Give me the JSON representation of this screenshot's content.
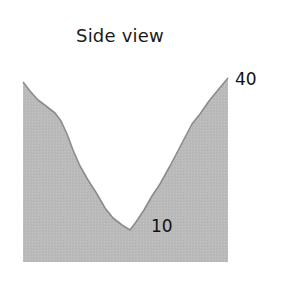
{
  "title": "Side view",
  "labels": {
    "top_value": "40",
    "bottom_value": "10"
  },
  "colors": {
    "fill": "#b9b9b9",
    "stroke": "#8c8c8c",
    "text": "#111111",
    "background": "#ffffff"
  },
  "profile": {
    "description": "V-shaped valley cross-section",
    "points": [
      [
        23,
        82
      ],
      [
        30,
        91
      ],
      [
        38,
        100
      ],
      [
        46,
        106
      ],
      [
        55,
        113
      ],
      [
        61,
        121
      ],
      [
        67,
        134
      ],
      [
        73,
        150
      ],
      [
        80,
        166
      ],
      [
        88,
        180
      ],
      [
        97,
        194
      ],
      [
        105,
        208
      ],
      [
        113,
        218
      ],
      [
        122,
        225
      ],
      [
        130,
        230
      ],
      [
        136,
        222
      ],
      [
        144,
        210
      ],
      [
        152,
        196
      ],
      [
        160,
        184
      ],
      [
        170,
        166
      ],
      [
        181,
        145
      ],
      [
        192,
        124
      ],
      [
        200,
        114
      ],
      [
        209,
        101
      ],
      [
        218,
        90
      ],
      [
        228,
        78
      ]
    ],
    "bottom_y": 262
  }
}
